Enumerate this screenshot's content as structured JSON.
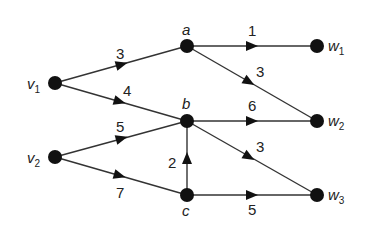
{
  "nodes": {
    "v1": {
      "name": "v",
      "sub": "1",
      "x": 55,
      "y": 83
    },
    "v2": {
      "name": "v",
      "sub": "2",
      "x": 55,
      "y": 157
    },
    "a": {
      "name": "a",
      "sub": "",
      "x": 187,
      "y": 46
    },
    "b": {
      "name": "b",
      "sub": "",
      "x": 187,
      "y": 121
    },
    "c": {
      "name": "c",
      "sub": "",
      "x": 187,
      "y": 195
    },
    "w1": {
      "name": "w",
      "sub": "1",
      "x": 317,
      "y": 46
    },
    "w2": {
      "name": "w",
      "sub": "2",
      "x": 317,
      "y": 121
    },
    "w3": {
      "name": "w",
      "sub": "3",
      "x": 317,
      "y": 195
    }
  },
  "edges": [
    {
      "from": "v1",
      "to": "a",
      "weight": "3"
    },
    {
      "from": "v1",
      "to": "b",
      "weight": "4"
    },
    {
      "from": "v2",
      "to": "b",
      "weight": "5"
    },
    {
      "from": "v2",
      "to": "c",
      "weight": "7"
    },
    {
      "from": "c",
      "to": "b",
      "weight": "2"
    },
    {
      "from": "a",
      "to": "w1",
      "weight": "1"
    },
    {
      "from": "a",
      "to": "w2",
      "weight": "3"
    },
    {
      "from": "b",
      "to": "w2",
      "weight": "6"
    },
    {
      "from": "b",
      "to": "w3",
      "weight": "3"
    },
    {
      "from": "c",
      "to": "w3",
      "weight": "5"
    }
  ],
  "labels": {
    "v1_name": "v",
    "v1_sub": "1",
    "v2_name": "v",
    "v2_sub": "2",
    "a": "a",
    "b": "b",
    "c": "c",
    "w1_name": "w",
    "w1_sub": "1",
    "w2_name": "w",
    "w2_sub": "2",
    "w3_name": "w",
    "w3_sub": "3",
    "e_v1a": "3",
    "e_v1b": "4",
    "e_v2b": "5",
    "e_v2c": "7",
    "e_cb": "2",
    "e_aw1": "1",
    "e_aw2": "3",
    "e_bw2": "6",
    "e_bw3": "3",
    "e_cw3": "5"
  }
}
